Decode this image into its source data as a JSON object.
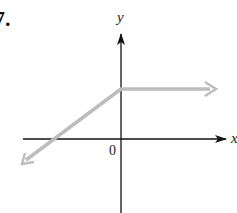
{
  "problem": {
    "number": "7."
  },
  "axes": {
    "x_label": "x",
    "y_label": "y",
    "origin_label": "0"
  },
  "graph": {
    "description": "Piecewise linear graph: line with positive slope rising from lower-left, reaching the y-axis at a positive y-intercept, then continuing horizontally to the right",
    "line_color": "#bdbdbd",
    "axis_color": "#111111",
    "segments": [
      {
        "from": "lower-left (arrow)",
        "to": "y-intercept",
        "slope": "positive"
      },
      {
        "from": "y-intercept",
        "to": "right (arrow)",
        "slope": "zero"
      }
    ]
  }
}
